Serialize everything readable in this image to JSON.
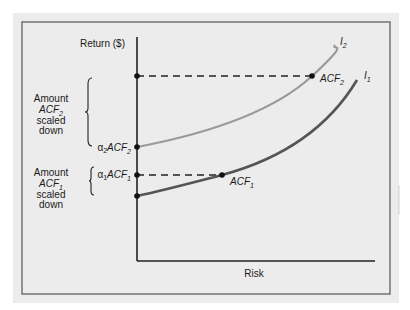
{
  "diagram": {
    "y_axis_label": "Return ($)",
    "x_axis_label": "Risk",
    "curves": [
      {
        "id": "I2",
        "label_main": "I",
        "label_sub": "2",
        "color": "#9a9a9a"
      },
      {
        "id": "I1",
        "label_main": "I",
        "label_sub": "1",
        "color": "#555555"
      }
    ],
    "points": {
      "acf2": {
        "main": "ACF",
        "sub": "2"
      },
      "acf1": {
        "main": "ACF",
        "sub": "1"
      },
      "alpha2_acf2": {
        "alpha": "α",
        "alpha_sub": "2",
        "main": "ACF",
        "sub": "2"
      },
      "alpha1_acf1": {
        "alpha": "α",
        "alpha_sub": "1",
        "main": "ACF",
        "sub": "1"
      }
    },
    "brace_labels": {
      "upper": {
        "line1": "Amount",
        "line2_main": "ACF",
        "line2_sub": "2",
        "line3": "scaled",
        "line4": "down"
      },
      "lower": {
        "line1": "Amount",
        "line2_main": "ACF",
        "line2_sub": "1",
        "line3": "scaled",
        "line4": "down"
      }
    },
    "colors": {
      "panel_bg": "#ececec",
      "axis": "#222222",
      "frame": "#555555"
    }
  }
}
